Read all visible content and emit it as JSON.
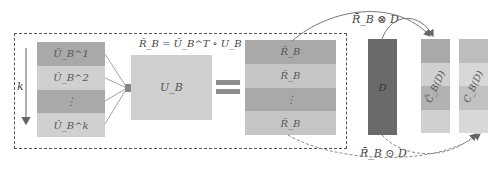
{
  "diagram": {
    "left_stack": {
      "rows": [
        "Ū_B^1",
        "Ū_B^2",
        "⋮",
        "Ū_B^k"
      ],
      "colors": [
        "#a9a9a9",
        "#d0d0d0",
        "#a9a9a9",
        "#d0d0d0"
      ]
    },
    "axis_label": "k",
    "formula": "R̄_B = Ū_B^T ∘ U_B",
    "ub_label": "U_B",
    "r_stack": {
      "rows": [
        "R̄_B",
        "R̄_B",
        "⋮",
        "R̄_B"
      ],
      "colors": [
        "#a9a9a9",
        "#c6c6c6",
        "#a9a9a9",
        "#c6c6c6"
      ]
    },
    "d_label": "D",
    "c_upper": {
      "label": "C̄_B(D)",
      "colors": [
        "#a9a9a9",
        "#d0d0d0",
        "#b2b2b2",
        "#d0d0d0"
      ]
    },
    "c_lower": {
      "label": "C_B(D)",
      "colors": [
        "#bdbdbd",
        "#d8d8d8",
        "#c2c2c2",
        "#d8d8d8"
      ]
    },
    "top_op_label": "R̄_B ⊗ D",
    "bottom_op_label": "R̄_B ⊙ D",
    "colors": {
      "d_block": "#6a6a6a",
      "ub_block": "#cfcfcf",
      "equals": "#8e8e8e",
      "lines": "#777777"
    }
  }
}
